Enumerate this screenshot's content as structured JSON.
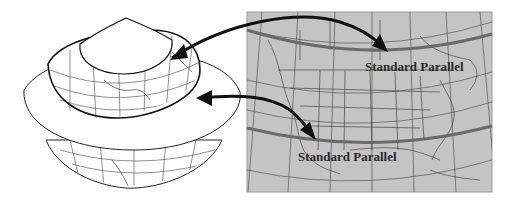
{
  "diagram": {
    "left_figure": {
      "description": "Globe intersected by a secant cone",
      "parts": [
        "cone-top",
        "globe-upper",
        "cone-brim",
        "globe-lower"
      ]
    },
    "right_figure": {
      "description": "Map of North America on a conic projection",
      "background_color": "#c4c4c4",
      "parallel_color": "#6a6a6a"
    },
    "labels": {
      "upper_parallel": "Standard Parallel",
      "lower_parallel": "Standard Parallel"
    },
    "arrows": [
      {
        "from": "globe-upper-intersection",
        "to": "upper-standard-parallel"
      },
      {
        "from": "lower-standard-parallel",
        "to": "globe-lower-intersection"
      },
      {
        "from": "globe-lower-intersection",
        "to": "lower-standard-parallel"
      }
    ],
    "colors": {
      "arrow": "#111111",
      "outline": "#222222",
      "map_fill": "#c4c4c4",
      "paper": "#ffffff"
    }
  }
}
